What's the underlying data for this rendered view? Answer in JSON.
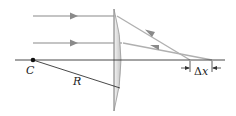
{
  "diagram": {
    "labels": {
      "center": "C",
      "radius": "R",
      "delta": "Δ",
      "delta_var": "x"
    },
    "colors": {
      "ray": "#a8a8a8",
      "arrow": "#8a8a8a",
      "axis": "#333333",
      "lens_fill": "#e4e4e4",
      "lens_edge": "#9a9a9a",
      "text": "#222222"
    },
    "rays": [
      {
        "name": "upper-ray",
        "y": 16
      },
      {
        "name": "middle-ray",
        "y": 43
      }
    ]
  }
}
